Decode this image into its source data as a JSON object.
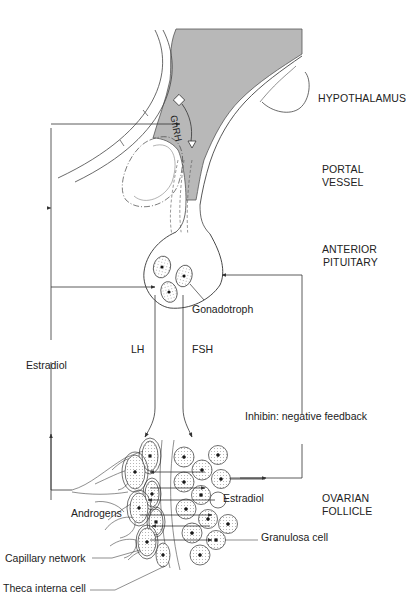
{
  "diagram": {
    "regions": {
      "hypothalamus": "HYPOTHALAMUS",
      "portal_line1": "PORTAL",
      "portal_line2": "VESSEL",
      "pituitary_line1": "ANTERIOR",
      "pituitary_line2": "PITUITARY",
      "follicle_line1": "OVARIAN",
      "follicle_line2": "FOLLICLE"
    },
    "labels": {
      "gnrh": "GnRH",
      "gonadotroph": "Gonadotroph",
      "lh": "LH",
      "fsh": "FSH",
      "estradiol_feedback": "Estradiol",
      "inhibin": "Inhibin: negative feedback",
      "estradiol_follicle": "Estradiol",
      "androgens": "Androgens",
      "granulosa": "Granulosa cell",
      "capillary": "Capillary network",
      "theca": "Theca interna cell"
    },
    "colors": {
      "shading": "#b8b8b8",
      "line": "#333333"
    }
  }
}
